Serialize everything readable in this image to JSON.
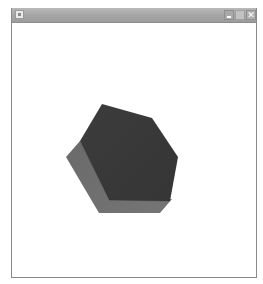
{
  "window": {
    "title": "",
    "controls": {
      "minimize_icon": "minimize-icon",
      "maximize_icon": "maximize-icon",
      "close_label": "✕"
    }
  },
  "scene": {
    "object": "hexagonal-prism",
    "colors": {
      "top_face": "#3a3a3a",
      "side_face": "#6e6e6e",
      "background": "#ffffff"
    }
  }
}
